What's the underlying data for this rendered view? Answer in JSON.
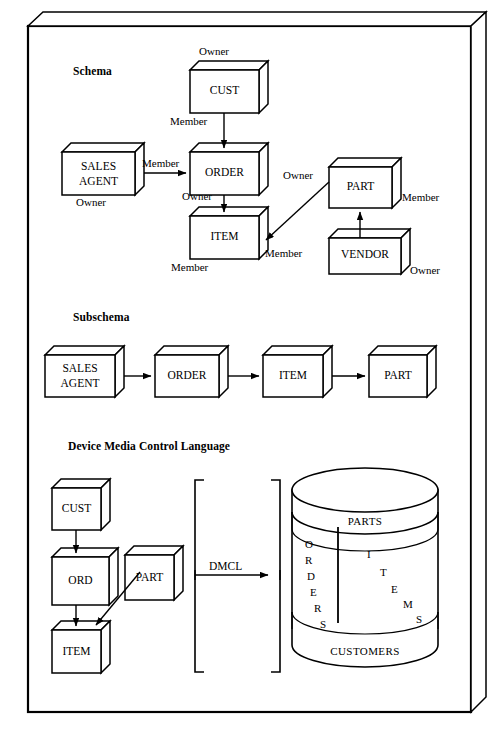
{
  "diagram": {
    "title_sections": {
      "schema": "Schema",
      "subschema": "Subschema",
      "dmcl": "Device Media Control Language"
    },
    "colors": {
      "ink": "#000000",
      "paper": "#ffffff"
    }
  },
  "schema": {
    "heading": "Schema",
    "boxes": [
      {
        "id": "cust",
        "label": "CUST"
      },
      {
        "id": "sales",
        "label_line1": "SALES",
        "label_line2": "AGENT"
      },
      {
        "id": "order",
        "label": "ORDER"
      },
      {
        "id": "item",
        "label": "ITEM"
      },
      {
        "id": "part",
        "label": "PART"
      },
      {
        "id": "vendor",
        "label": "VENDOR"
      }
    ],
    "role_labels": {
      "cust_owner": "Owner",
      "cust_member": "Member",
      "sales_member": "Member",
      "sales_owner": "Owner",
      "order_owner": "Owner",
      "item_member_left": "Member",
      "item_member_right": "Member",
      "part_owner": "Owner",
      "part_member": "Member",
      "vendor_owner": "Owner"
    }
  },
  "subschema": {
    "heading": "Subschema",
    "boxes": [
      {
        "id": "sales",
        "label_line1": "SALES",
        "label_line2": "AGENT"
      },
      {
        "id": "order",
        "label": "ORDER"
      },
      {
        "id": "item",
        "label": "ITEM"
      },
      {
        "id": "part",
        "label": "PART"
      }
    ]
  },
  "dmcl": {
    "heading": "Device Media Control Language",
    "boxes": [
      {
        "id": "cust",
        "label": "CUST"
      },
      {
        "id": "ord",
        "label": "ORD"
      },
      {
        "id": "part",
        "label": "PART"
      },
      {
        "id": "item",
        "label": "ITEM"
      }
    ],
    "arrow_label": "DMCL",
    "database": {
      "top_band_label": "PARTS",
      "bottom_band_label": "CUSTOMERS",
      "left_region_label": "ORDERS",
      "right_region_label": "ITEMS",
      "left_region_letters": [
        "O",
        "R",
        "D",
        "E",
        "R",
        "S"
      ],
      "right_region_letters": [
        "I",
        "T",
        "E",
        "M",
        "S"
      ]
    }
  }
}
